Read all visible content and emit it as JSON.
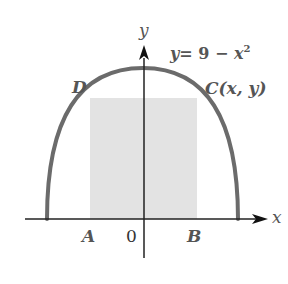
{
  "figure": {
    "equation": {
      "lhs": "y",
      "rhs": "= 9 − ",
      "var": "x",
      "exp": "2"
    },
    "axis_labels": {
      "x": "x",
      "y": "y"
    },
    "points": {
      "A": "A",
      "B": "B",
      "C": "C(x, y)",
      "D": "D",
      "origin": "0"
    },
    "colors": {
      "curve": "#6b6b6b",
      "axes": "#222222",
      "rectangle_fill": "#e3e3e3",
      "label": "#555555"
    }
  }
}
